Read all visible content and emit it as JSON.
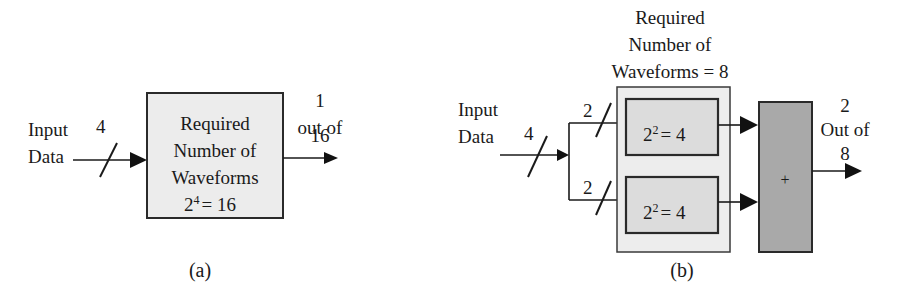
{
  "diagram_a": {
    "input_label": [
      "Input",
      "Data"
    ],
    "bus_width": "4",
    "block_lines": [
      "Required",
      "Number of",
      "Waveforms"
    ],
    "block_formula_base": "2",
    "block_formula_exp": "4",
    "block_formula_rest": "= 16",
    "output_label": [
      "1",
      "out of",
      "16"
    ],
    "caption": "(a)"
  },
  "diagram_b": {
    "title_lines": [
      "Required",
      "Number of",
      "Waveforms = 8"
    ],
    "input_label": [
      "Input",
      "Data"
    ],
    "bus_width": "4",
    "branch_top_width": "2",
    "branch_bottom_width": "2",
    "inner_block_top": {
      "base": "2",
      "exp": "2",
      "rest": "= 4"
    },
    "inner_block_bottom": {
      "base": "2",
      "exp": "2",
      "rest": "= 4"
    },
    "sum_symbol": "+",
    "output_label": [
      "2",
      "Out of",
      "8"
    ],
    "caption": "(b)"
  },
  "colors": {
    "block_fill": "#ececec",
    "inner_block_fill": "#dcdcdc",
    "sum_block_fill": "#a9a9a9",
    "line": "#1a1a1a"
  }
}
